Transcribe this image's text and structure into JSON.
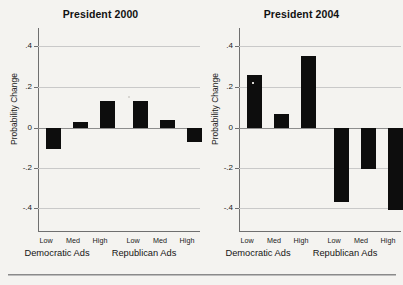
{
  "figure": {
    "background_color": "#f4f3f0",
    "bar_color": "#0d0d0d",
    "grid_color": "#c9c9c9",
    "axis_color": "#6f6f6f",
    "caption_faint": ""
  },
  "panels": [
    {
      "key": "president_2000",
      "title": "President 2000",
      "ylabel": "Probability Change",
      "ytick_labels": [
        ".4",
        ".2",
        "0",
        "-.2",
        "-.4"
      ],
      "level_labels": [
        "Low",
        "Med",
        "High",
        "Low",
        "Med",
        "High"
      ],
      "group_labels": [
        "Democratic Ads",
        "Republican Ads"
      ]
    },
    {
      "key": "president_2004",
      "title": "President 2004",
      "ylabel": "Probability Change",
      "ytick_labels": [
        ".4",
        ".2",
        "0",
        "-.2",
        "-.4"
      ],
      "level_labels": [
        "Low",
        "Med",
        "High",
        "Low",
        "Med",
        "High"
      ],
      "group_labels": [
        "Democratic Ads",
        "Republican Ads"
      ]
    }
  ],
  "chart_data": [
    {
      "type": "bar",
      "title": "President 2000",
      "xlabel": "",
      "ylabel": "Probability Change",
      "ylim": [
        -0.5,
        0.5
      ],
      "yticks": [
        0.4,
        0.2,
        0,
        -0.2,
        -0.4
      ],
      "ytick_labels": [
        ".4",
        ".2",
        "0",
        "-.2",
        "-.4"
      ],
      "grid": true,
      "legend": "none",
      "groups": [
        "Democratic Ads",
        "Republican Ads"
      ],
      "categories": [
        "Low",
        "Med",
        "High",
        "Low",
        "Med",
        "High"
      ],
      "values": [
        -0.1,
        0.03,
        0.13,
        0.13,
        0.04,
        -0.07
      ],
      "bars": [
        {
          "group": "Democratic Ads",
          "level": "Low",
          "value": -0.1
        },
        {
          "group": "Democratic Ads",
          "level": "Med",
          "value": 0.03
        },
        {
          "group": "Democratic Ads",
          "level": "High",
          "value": 0.13
        },
        {
          "group": "Republican Ads",
          "level": "Low",
          "value": 0.13
        },
        {
          "group": "Republican Ads",
          "level": "Med",
          "value": 0.04
        },
        {
          "group": "Republican Ads",
          "level": "High",
          "value": -0.07
        }
      ]
    },
    {
      "type": "bar",
      "title": "President 2004",
      "xlabel": "",
      "ylabel": "Probability Change",
      "ylim": [
        -0.5,
        0.5
      ],
      "yticks": [
        0.4,
        0.2,
        0,
        -0.2,
        -0.4
      ],
      "ytick_labels": [
        ".4",
        ".2",
        "0",
        "-.2",
        "-.4"
      ],
      "grid": true,
      "legend": "none",
      "groups": [
        "Democratic Ads",
        "Republican Ads"
      ],
      "categories": [
        "Low",
        "Med",
        "High",
        "Low",
        "Med",
        "High"
      ],
      "values": [
        0.26,
        0.07,
        0.35,
        -0.36,
        -0.2,
        -0.4
      ],
      "bars": [
        {
          "group": "Democratic Ads",
          "level": "Low",
          "value": 0.26
        },
        {
          "group": "Democratic Ads",
          "level": "Med",
          "value": 0.07
        },
        {
          "group": "Democratic Ads",
          "level": "High",
          "value": 0.35
        },
        {
          "group": "Republican Ads",
          "level": "Low",
          "value": -0.36
        },
        {
          "group": "Republican Ads",
          "level": "Med",
          "value": -0.2
        },
        {
          "group": "Republican Ads",
          "level": "High",
          "value": -0.4
        }
      ]
    }
  ]
}
